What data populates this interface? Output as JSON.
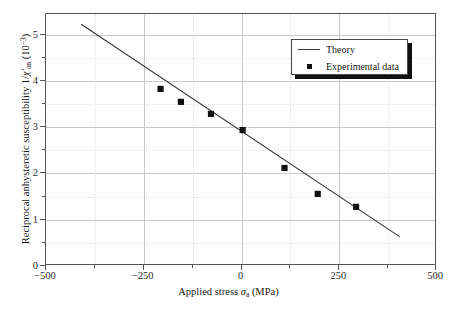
{
  "chart_data": {
    "type": "scatter",
    "title": "",
    "xlabel": "Applied stress σa (MPa)",
    "ylabel": "Reciprocal anhysteretic susceptibility 1/χ'an (10⁻³)",
    "xlim": [
      -500,
      500
    ],
    "ylim": [
      0,
      5.45
    ],
    "grid": true,
    "legend_position": "upper right",
    "x_ticks_major": [
      -500,
      -250,
      0,
      250,
      500
    ],
    "x_tick_labels": [
      "−500",
      "−250",
      "0",
      "250",
      "500"
    ],
    "x_ticks_minor": [
      -375,
      -125,
      125,
      375
    ],
    "y_ticks_major": [
      0,
      1,
      2,
      3,
      4,
      5
    ],
    "y_tick_labels": [
      "0",
      "1",
      "2",
      "3",
      "4",
      "5"
    ],
    "y_ticks_minor": [
      0.5,
      1.5,
      2.5,
      3.5,
      4.5
    ],
    "series": [
      {
        "name": "Theory",
        "type": "line",
        "x": [
          -410,
          405
        ],
        "values": [
          5.23,
          0.63
        ],
        "color": "#333333"
      },
      {
        "name": "Experimental data",
        "type": "scatter",
        "marker": "square",
        "color": "#111111",
        "x": [
          -207,
          -155,
          -78,
          3,
          110,
          195,
          293
        ],
        "values": [
          3.83,
          3.55,
          3.29,
          2.94,
          2.12,
          1.56,
          1.28
        ]
      }
    ]
  },
  "legend": {
    "entries": [
      {
        "label": "Theory",
        "key": "line"
      },
      {
        "label": "Experimental data",
        "key": "square"
      }
    ]
  },
  "axis_label_parts": {
    "x_prefix": "Applied stress ",
    "x_symbol": "σ",
    "x_subscript": "a",
    "x_units": " (MPa)",
    "y_prefix": "Reciprocal anhysteretic susceptibility 1/",
    "y_symbol": "χ′",
    "y_subscript": "an",
    "y_units_open": " (10",
    "y_units_exp": "−3",
    "y_units_close": ")"
  },
  "colors": {
    "background": "#ffffff",
    "frame": "#555555",
    "grid_major": "#c9c9c9",
    "grid_minor": "#cfcfcf",
    "line": "#333333",
    "marker": "#111111",
    "text": "#1a1a1a",
    "legend_shadow": "#111111"
  }
}
